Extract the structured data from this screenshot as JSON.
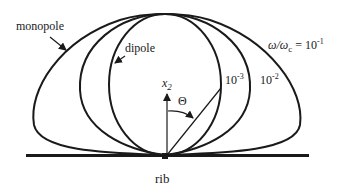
{
  "diagram": {
    "type": "radiation-pattern",
    "labels": {
      "monopole": "monopole",
      "dipole": "dipole",
      "rib": "rib",
      "axis": "x",
      "axis_sub": "2",
      "angle": "Θ",
      "ratio_prefix": "ω/ω",
      "ratio_sub": "c",
      "ratio_eq": " = 10",
      "ratio_exp": "-1",
      "curve_m3_base": "10",
      "curve_m3_exp": "-3",
      "curve_m2_base": "10",
      "curve_m2_exp": "-2"
    },
    "curves": [
      {
        "name": "dipole",
        "value": "10^-3"
      },
      {
        "name": "intermediate",
        "value": "10^-2"
      },
      {
        "name": "monopole",
        "value": "10^-1"
      }
    ],
    "colors": {
      "stroke": "#1a1a1a",
      "background": "#ffffff"
    }
  }
}
